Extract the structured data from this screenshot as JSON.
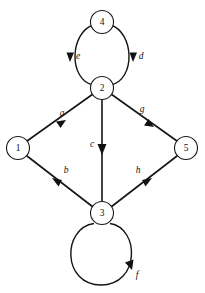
{
  "figure": {
    "kind": "directed-graph-diagram",
    "background_color": "#ffffff",
    "stroke_color": "#151515",
    "width": 205,
    "height": 293
  },
  "nodes": [
    {
      "id": "1",
      "label": "1",
      "cx": 18,
      "cy": 148,
      "r": 11.5
    },
    {
      "id": "2",
      "label": "2",
      "cx": 102,
      "cy": 88,
      "r": 11.5
    },
    {
      "id": "3",
      "label": "3",
      "cx": 102,
      "cy": 213,
      "r": 11.5
    },
    {
      "id": "4",
      "label": "4",
      "cx": 102,
      "cy": 22,
      "r": 11.5
    },
    {
      "id": "5",
      "label": "5",
      "cx": 186,
      "cy": 148,
      "r": 11.5
    }
  ],
  "edges": [
    {
      "id": "a",
      "label": "a",
      "from": "1",
      "to": "2",
      "shape": "straight",
      "label_x": 62,
      "label_y": 114,
      "arrow_x": 62,
      "arrow_y": 124,
      "arrow_angle": -35
    },
    {
      "id": "b",
      "label": "b",
      "from": "3",
      "to": "1",
      "shape": "straight",
      "label_x": 66,
      "label_y": 171,
      "arrow_x": 55,
      "arrow_y": 181,
      "arrow_angle": 215
    },
    {
      "id": "c",
      "label": "c",
      "from": "2",
      "to": "3",
      "shape": "straight",
      "label_x": 92,
      "label_y": 145,
      "arrow_x": 102,
      "arrow_y": 152,
      "arrow_angle": 90
    },
    {
      "id": "d",
      "label": "d",
      "from": "4",
      "to": "2",
      "shape": "arc-right",
      "label_x": 141,
      "label_y": 57,
      "arrow_x": 133,
      "arrow_y": 57,
      "arrow_angle": 98
    },
    {
      "id": "e",
      "label": "e",
      "from": "4",
      "to": "2",
      "shape": "arc-left",
      "label_x": 78,
      "label_y": 57,
      "arrow_x": 70,
      "arrow_y": 57,
      "arrow_angle": 82
    },
    {
      "id": "f",
      "label": "f",
      "from": "3",
      "to": "3",
      "shape": "self-loop",
      "label_x": 137,
      "label_y": 276,
      "arrow_x": 131,
      "arrow_y": 268,
      "arrow_angle": -57,
      "loop_cx": 101,
      "loop_cy": 251,
      "loop_r": 34
    },
    {
      "id": "g",
      "label": "g",
      "from": "2",
      "to": "5",
      "shape": "straight",
      "label_x": 142,
      "label_y": 110,
      "arrow_x": 150,
      "arrow_y": 124,
      "arrow_angle": 35
    },
    {
      "id": "h",
      "label": "h",
      "from": "3",
      "to": "5",
      "shape": "straight",
      "label_x": 138,
      "label_y": 171,
      "arrow_x": 149,
      "arrow_y": 181,
      "arrow_angle": -35
    }
  ]
}
